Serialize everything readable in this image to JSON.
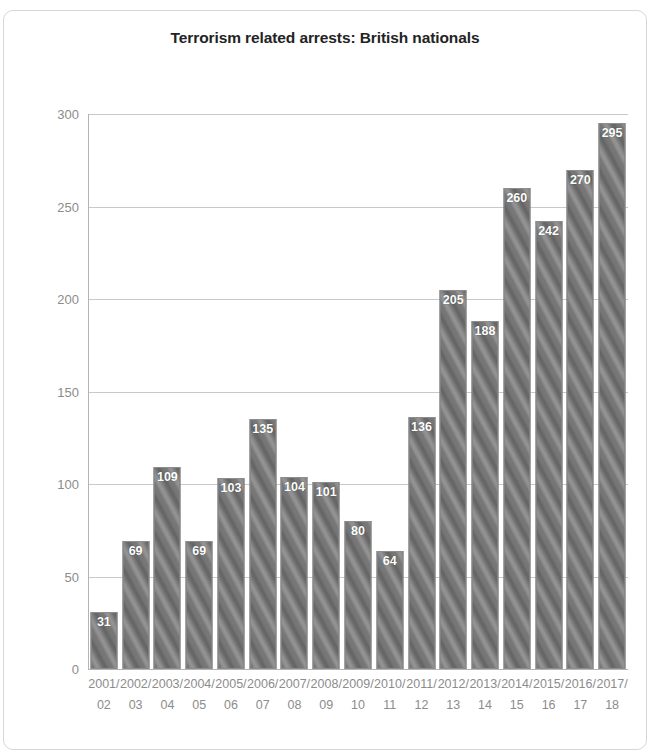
{
  "chart_data": {
    "type": "bar",
    "title": "Terrorism related arrests: British nationals",
    "xlabel": "",
    "ylabel": "",
    "ylim": [
      0,
      300
    ],
    "yticks": [
      0,
      50,
      100,
      150,
      200,
      250,
      300
    ],
    "grid": true,
    "legend": "none",
    "bar_color": "#777777",
    "bar_pattern": "diagonal-stripes",
    "label_color": "#ffffff",
    "axis_text_color": "#8c8c8c",
    "title_color": "#232323",
    "categories": [
      "2001/ 02",
      "2002/ 03",
      "2003/ 04",
      "2004/ 05",
      "2005/ 06",
      "2006/ 07",
      "2007/ 08",
      "2008/ 09",
      "2009/ 10",
      "2010/ 11",
      "2011/ 12",
      "2012/ 13",
      "2013/ 14",
      "2014/ 15",
      "2015/ 16",
      "2016/ 17",
      "2017/ 18"
    ],
    "category_lines": [
      [
        "2001/",
        "02"
      ],
      [
        "2002/",
        "03"
      ],
      [
        "2003/",
        "04"
      ],
      [
        "2004/",
        "05"
      ],
      [
        "2005/",
        "06"
      ],
      [
        "2006/",
        "07"
      ],
      [
        "2007/",
        "08"
      ],
      [
        "2008/",
        "09"
      ],
      [
        "2009/",
        "10"
      ],
      [
        "2010/",
        "11"
      ],
      [
        "2011/",
        "12"
      ],
      [
        "2012/",
        "13"
      ],
      [
        "2013/",
        "14"
      ],
      [
        "2014/",
        "15"
      ],
      [
        "2015/",
        "16"
      ],
      [
        "2016/",
        "17"
      ],
      [
        "2017/",
        "18"
      ]
    ],
    "values": [
      31,
      69,
      109,
      69,
      103,
      135,
      104,
      101,
      80,
      64,
      136,
      205,
      188,
      260,
      242,
      270,
      295
    ]
  }
}
